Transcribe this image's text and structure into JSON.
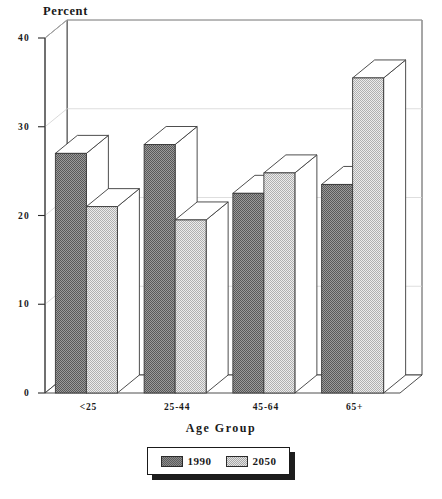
{
  "chart_data": {
    "type": "bar",
    "title": "",
    "ylabel": "Percent",
    "xlabel": "Age Group",
    "categories": [
      "<25",
      "25-44",
      "45-64",
      "65+"
    ],
    "series": [
      {
        "name": "1990",
        "values": [
          27.0,
          28.0,
          22.5,
          23.5
        ],
        "color": "#7a7a7a"
      },
      {
        "name": "2050",
        "values": [
          21.0,
          19.5,
          24.8,
          35.5
        ],
        "color": "#d9d9d9"
      }
    ],
    "ylim": [
      0,
      40
    ],
    "yticks": [
      0,
      10,
      20,
      30,
      40
    ],
    "ytick_labels": [
      "0",
      "10",
      "20",
      "30",
      "40"
    ],
    "grid": true,
    "grid_axis": "y",
    "legend_position": "bottom-center",
    "style": "3d-bar"
  },
  "legend": {
    "entries": [
      {
        "label": "1990",
        "swatch": "legend-swatch-1990"
      },
      {
        "label": "2050",
        "swatch": "legend-swatch-2050"
      }
    ]
  },
  "colors": {
    "series_1990": "#7a7a7a",
    "series_2050": "#d9d9d9",
    "axis": "#2a2a2a",
    "grid": "#d0d0d0",
    "background": "#ffffff"
  }
}
